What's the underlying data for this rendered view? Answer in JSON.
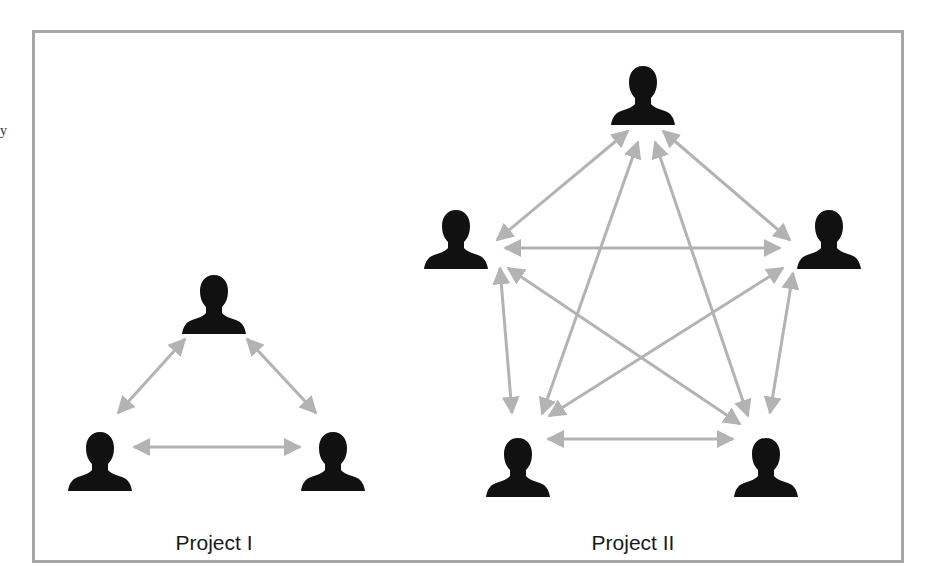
{
  "figure": {
    "frame_color": "#a7a7a7",
    "arrow_color": "#b3b3b3",
    "person_color": "#111111",
    "stray_margin_text": "y"
  },
  "projects": [
    {
      "label": "Project I",
      "label_pos": [
        214,
        535
      ],
      "team_size": 3,
      "nodes": [
        {
          "id": "top",
          "x": 214,
          "y": 303
        },
        {
          "id": "bottom-left",
          "x": 100,
          "y": 460
        },
        {
          "id": "bottom-right",
          "x": 333,
          "y": 460
        }
      ],
      "edges": [
        {
          "from": [
            185,
            339
          ],
          "to": [
            118,
            413
          ]
        },
        {
          "from": [
            247,
            339
          ],
          "to": [
            316,
            413
          ]
        },
        {
          "from": [
            134,
            447
          ],
          "to": [
            300,
            447
          ]
        }
      ]
    },
    {
      "label": "Project II",
      "label_pos": [
        633,
        535
      ],
      "team_size": 5,
      "nodes": [
        {
          "id": "top",
          "x": 643,
          "y": 94
        },
        {
          "id": "left",
          "x": 456,
          "y": 238
        },
        {
          "id": "right",
          "x": 829,
          "y": 238
        },
        {
          "id": "bottom-left",
          "x": 518,
          "y": 466
        },
        {
          "id": "bottom-right",
          "x": 766,
          "y": 466
        }
      ],
      "edges": [
        {
          "from": [
            628,
            131
          ],
          "to": [
            497,
            240
          ]
        },
        {
          "from": [
            663,
            131
          ],
          "to": [
            790,
            240
          ]
        },
        {
          "from": [
            505,
            248
          ],
          "to": [
            780,
            248
          ]
        },
        {
          "from": [
            638,
            142
          ],
          "to": [
            542,
            414
          ]
        },
        {
          "from": [
            655,
            142
          ],
          "to": [
            748,
            416
          ]
        },
        {
          "from": [
            500,
            268
          ],
          "to": [
            512,
            413
          ]
        },
        {
          "from": [
            793,
            273
          ],
          "to": [
            770,
            413
          ]
        },
        {
          "from": [
            508,
            268
          ],
          "to": [
            740,
            424
          ]
        },
        {
          "from": [
            783,
            268
          ],
          "to": [
            549,
            416
          ]
        },
        {
          "from": [
            548,
            439
          ],
          "to": [
            733,
            439
          ]
        }
      ]
    }
  ]
}
